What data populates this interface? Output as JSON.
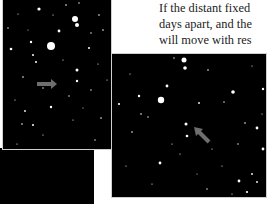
{
  "text": {
    "lines": [
      "If the distant fixed",
      "days apart, and the",
      "will move with res"
    ]
  },
  "images": {
    "left": {
      "description": "star-field-image-1",
      "arrow": {
        "direction": "right",
        "color": "#6e6e6e"
      }
    },
    "right": {
      "description": "star-field-image-2",
      "arrow": {
        "direction": "up-left",
        "color": "#6e6e6e"
      }
    }
  }
}
